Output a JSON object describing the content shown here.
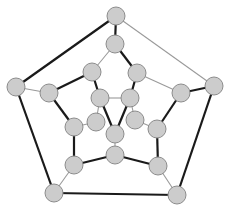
{
  "diagram": {
    "type": "graph",
    "colors": {
      "node_fill": "#cccccc",
      "node_stroke": "#8c8c8c",
      "thick_edge": "#1a1a1a",
      "thin_edge": "#9a9a9a",
      "background": "#ffffff"
    },
    "node_radius": 9,
    "nodes": [
      {
        "id": "O0",
        "x": 116,
        "y": 16
      },
      {
        "id": "O1",
        "x": 214,
        "y": 86
      },
      {
        "id": "O2",
        "x": 177,
        "y": 195
      },
      {
        "id": "O3",
        "x": 54,
        "y": 193
      },
      {
        "id": "O4",
        "x": 16,
        "y": 87
      },
      {
        "id": "M0",
        "x": 115,
        "y": 44
      },
      {
        "id": "M1",
        "x": 137,
        "y": 73
      },
      {
        "id": "M2",
        "x": 181,
        "y": 93
      },
      {
        "id": "M3",
        "x": 157,
        "y": 129
      },
      {
        "id": "M4",
        "x": 158,
        "y": 166
      },
      {
        "id": "M5",
        "x": 115,
        "y": 155
      },
      {
        "id": "M6",
        "x": 74,
        "y": 165
      },
      {
        "id": "M7",
        "x": 74,
        "y": 127
      },
      {
        "id": "M8",
        "x": 49,
        "y": 93
      },
      {
        "id": "M9",
        "x": 92,
        "y": 72
      },
      {
        "id": "I0",
        "x": 100,
        "y": 98
      },
      {
        "id": "I1",
        "x": 130,
        "y": 98
      },
      {
        "id": "I2",
        "x": 135,
        "y": 120
      },
      {
        "id": "I3",
        "x": 115,
        "y": 134
      },
      {
        "id": "I4",
        "x": 96,
        "y": 122
      }
    ],
    "edges": [
      {
        "from": "O0",
        "to": "O4",
        "style": "thick"
      },
      {
        "from": "O0",
        "to": "O1",
        "style": "thin"
      },
      {
        "from": "O0",
        "to": "M0",
        "style": "thick"
      },
      {
        "from": "O1",
        "to": "M2",
        "style": "thick"
      },
      {
        "from": "O1",
        "to": "O2",
        "style": "thick"
      },
      {
        "from": "O2",
        "to": "M4",
        "style": "thin"
      },
      {
        "from": "O2",
        "to": "O3",
        "style": "thick"
      },
      {
        "from": "O3",
        "to": "M6",
        "style": "thin"
      },
      {
        "from": "O3",
        "to": "O4",
        "style": "thick"
      },
      {
        "from": "O4",
        "to": "M8",
        "style": "thin"
      },
      {
        "from": "M0",
        "to": "M9",
        "style": "thin"
      },
      {
        "from": "M0",
        "to": "M1",
        "style": "thick"
      },
      {
        "from": "M1",
        "to": "M2",
        "style": "thin"
      },
      {
        "from": "M1",
        "to": "I1",
        "style": "thick"
      },
      {
        "from": "M2",
        "to": "M3",
        "style": "thick"
      },
      {
        "from": "M3",
        "to": "M4",
        "style": "thick"
      },
      {
        "from": "M3",
        "to": "I2",
        "style": "thin"
      },
      {
        "from": "M4",
        "to": "M5",
        "style": "thick"
      },
      {
        "from": "M5",
        "to": "M6",
        "style": "thick"
      },
      {
        "from": "M5",
        "to": "I3",
        "style": "thin"
      },
      {
        "from": "M6",
        "to": "M7",
        "style": "thick"
      },
      {
        "from": "M7",
        "to": "M8",
        "style": "thick"
      },
      {
        "from": "M7",
        "to": "I4",
        "style": "thin"
      },
      {
        "from": "M8",
        "to": "M9",
        "style": "thick"
      },
      {
        "from": "M9",
        "to": "I0",
        "style": "thick"
      },
      {
        "from": "I0",
        "to": "I1",
        "style": "thin"
      },
      {
        "from": "I0",
        "to": "I3",
        "style": "thick"
      },
      {
        "from": "I1",
        "to": "I3",
        "style": "thick"
      },
      {
        "from": "I4",
        "to": "I0",
        "style": "thin"
      },
      {
        "from": "I2",
        "to": "I1",
        "style": "thin"
      }
    ]
  }
}
